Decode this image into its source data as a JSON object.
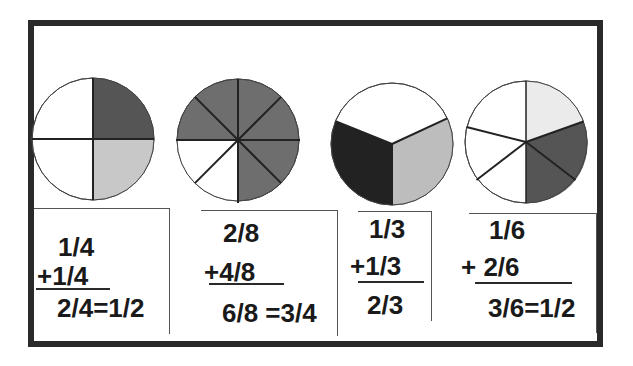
{
  "colors": {
    "frame": "#2a2a2a",
    "dark": "#555555",
    "medium": "#6e6e6e",
    "light": "#c8c8c8",
    "very_light": "#ebebeb",
    "black": "#222222",
    "white": "#ffffff"
  },
  "problems": [
    {
      "circle": {
        "parts": 4,
        "shaded_first": "1/4",
        "shaded_second": "1/4"
      },
      "addend1": "1/4",
      "addend2": "+1/4",
      "result": "2/4=1/2"
    },
    {
      "circle": {
        "parts": 8,
        "shaded_first": "2/8",
        "shaded_second": "4/8"
      },
      "addend1": "2/8",
      "addend2": "+4/8",
      "result": "6/8 =3/4"
    },
    {
      "circle": {
        "parts": 3,
        "shaded_first": "1/3",
        "shaded_second": "1/3"
      },
      "addend1": "1/3",
      "addend2": "+1/3",
      "result": "2/3"
    },
    {
      "circle": {
        "parts": 6,
        "shaded_first": "1/6",
        "shaded_second": "2/6"
      },
      "addend1": "1/6",
      "addend2": "+ 2/6",
      "result": "3/6=1/2"
    }
  ]
}
